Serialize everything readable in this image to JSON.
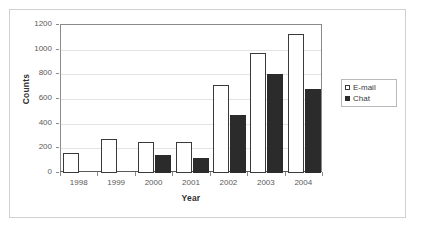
{
  "chart_data": {
    "type": "bar",
    "title": "",
    "xlabel": "Year",
    "ylabel": "Counts",
    "categories": [
      "1998",
      "1999",
      "2000",
      "2001",
      "2002",
      "2003",
      "2004"
    ],
    "series": [
      {
        "name": "E-mail",
        "color": "#ffffff",
        "edge_color": "#3a3a3a",
        "values": [
          165,
          275,
          248,
          248,
          715,
          970,
          1130
        ]
      },
      {
        "name": "Chat",
        "color": "#2b2b2b",
        "edge_color": "#2b2b2b",
        "values": [
          0,
          0,
          150,
          122,
          470,
          805,
          680
        ]
      }
    ],
    "ylim": [
      0,
      1200
    ],
    "ytick_labels": [
      "0",
      "200",
      "400",
      "600",
      "800",
      "1000",
      "1200"
    ],
    "ytick_values": [
      0,
      200,
      400,
      600,
      800,
      1000,
      1200
    ],
    "grid": "horizontal",
    "legend_position": "right-outside",
    "legend_entries": [
      "E-mail",
      "Chat"
    ]
  },
  "axes": {
    "x_title": "Year",
    "y_title": "Counts"
  },
  "legend": {
    "items": [
      {
        "label": "E-mail",
        "marker": "hollow-square-icon"
      },
      {
        "label": "Chat",
        "marker": "filled-square-icon"
      }
    ]
  }
}
